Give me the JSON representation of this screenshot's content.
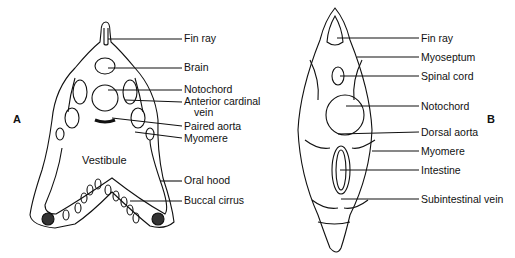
{
  "figure": {
    "panels": [
      {
        "id": "A",
        "letter": "A",
        "labels": [
          {
            "text": "Fin ray",
            "x": 183,
            "y": 33
          },
          {
            "text": "Brain",
            "x": 183,
            "y": 64
          },
          {
            "text": "Notochord",
            "x": 183,
            "y": 85
          },
          {
            "text": "Anterior cardinal",
            "x": 183,
            "y": 98
          },
          {
            "text": "vein",
            "x": 193,
            "y": 109
          },
          {
            "text": "Paired aorta",
            "x": 183,
            "y": 122
          },
          {
            "text": "Myomere",
            "x": 183,
            "y": 134
          },
          {
            "text": "Vestibule",
            "x": 82,
            "y": 154
          },
          {
            "text": "Oral hood",
            "x": 183,
            "y": 176
          },
          {
            "text": "Buccal cirrus",
            "x": 183,
            "y": 196
          }
        ]
      },
      {
        "id": "B",
        "letter": "B",
        "labels": [
          {
            "text": "Fin ray",
            "x": 420,
            "y": 33
          },
          {
            "text": "Myoseptum",
            "x": 420,
            "y": 52
          },
          {
            "text": "Spinal cord",
            "x": 420,
            "y": 71
          },
          {
            "text": "Notochord",
            "x": 420,
            "y": 101
          },
          {
            "text": "Dorsal aorta",
            "x": 420,
            "y": 127
          },
          {
            "text": "Myomere",
            "x": 420,
            "y": 146
          },
          {
            "text": "Intestine",
            "x": 420,
            "y": 165
          },
          {
            "text": "Subintestinal vein",
            "x": 420,
            "y": 194
          }
        ]
      }
    ]
  }
}
